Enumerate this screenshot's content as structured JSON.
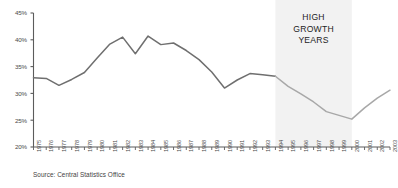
{
  "chart_data": {
    "type": "line",
    "title": "",
    "subtitle": "",
    "xlabel": "",
    "ylabel": "",
    "ylim": [
      20,
      45
    ],
    "ytick_values": [
      20,
      25,
      30,
      35,
      40,
      45
    ],
    "ytick_labels": [
      "20%",
      "25%",
      "30%",
      "35%",
      "40%",
      "45%"
    ],
    "grid": false,
    "legend": "none",
    "categories": [
      "1975",
      "1976",
      "1977",
      "1978",
      "1979",
      "1980",
      "1981",
      "1982",
      "1983",
      "1984",
      "1985",
      "1986",
      "1987",
      "1988",
      "1989",
      "1990",
      "1991",
      "1992",
      "1993",
      "1994",
      "1995",
      "1996",
      "1997",
      "1998",
      "1999",
      "2000",
      "2001",
      "2002",
      "2003"
    ],
    "series": [
      {
        "name": "Share",
        "values": [
          32.9,
          32.8,
          31.5,
          32.6,
          33.9,
          36.6,
          39.2,
          40.5,
          37.4,
          40.7,
          39.1,
          39.4,
          38.0,
          36.3,
          34.0,
          31.0,
          32.5,
          33.7,
          33.5,
          33.2,
          31.3,
          29.9,
          28.4,
          26.6,
          25.9,
          25.2,
          27.3,
          29.1,
          30.6
        ]
      }
    ],
    "annotations": [
      {
        "name": "high-growth-band-label",
        "lines": [
          "HIGH",
          "GROWTH",
          "YEARS"
        ]
      }
    ],
    "shaded_band": {
      "label": "HIGH GROWTH YEARS",
      "start_category": "1994",
      "end_category": "2000",
      "color": "#f2f2f2"
    },
    "source_note": "Source: Central Statistics Office",
    "colors": {
      "line_primary": "#6f6f6f",
      "line_secondary": "#a8a8a8",
      "axis": "#5c5c5c",
      "text": "#4a4a4a",
      "band": "#f2f2f2",
      "background": "#ffffff"
    }
  }
}
